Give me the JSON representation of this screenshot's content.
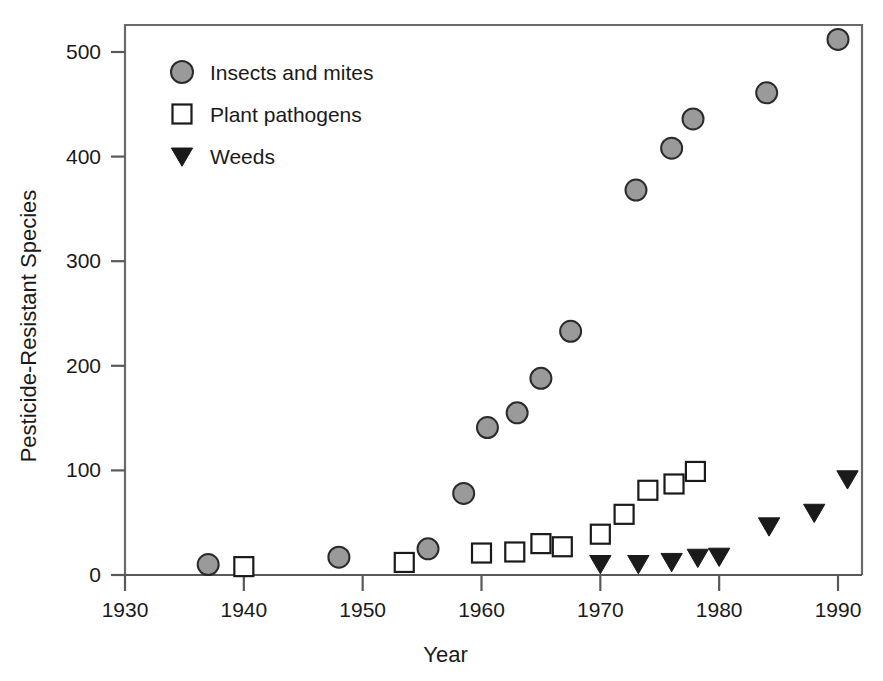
{
  "chart_data": {
    "type": "scatter",
    "title": "",
    "xlabel": "Year",
    "ylabel": "Pesticide-Resistant Species",
    "xlim": [
      1930,
      1992
    ],
    "ylim": [
      0,
      530
    ],
    "xticks": [
      1930,
      1940,
      1950,
      1960,
      1970,
      1980,
      1990
    ],
    "yticks": [
      0,
      100,
      200,
      300,
      400,
      500
    ],
    "xtick_labels": [
      "1930",
      "1940",
      "1950",
      "1960",
      "1970",
      "1980",
      "1990"
    ],
    "ytick_labels": [
      "0",
      "100",
      "200",
      "300",
      "400",
      "500"
    ],
    "grid": false,
    "legend_position": "upper-left-inside",
    "series": [
      {
        "name": "Insects and mites",
        "marker": "circle",
        "fill_color": "#9a9a9a",
        "edge_color": "#2b2b2b",
        "points": [
          {
            "x": 1937.0,
            "y": 10
          },
          {
            "x": 1948.0,
            "y": 17
          },
          {
            "x": 1955.5,
            "y": 25
          },
          {
            "x": 1958.5,
            "y": 78
          },
          {
            "x": 1960.5,
            "y": 141
          },
          {
            "x": 1963.0,
            "y": 155
          },
          {
            "x": 1965.0,
            "y": 188
          },
          {
            "x": 1967.5,
            "y": 233
          },
          {
            "x": 1973.0,
            "y": 368
          },
          {
            "x": 1976.0,
            "y": 408
          },
          {
            "x": 1977.8,
            "y": 436
          },
          {
            "x": 1984.0,
            "y": 461
          },
          {
            "x": 1990.0,
            "y": 512
          }
        ]
      },
      {
        "name": "Plant pathogens",
        "marker": "square",
        "fill_color": "#ffffff",
        "edge_color": "#1a1a1a",
        "points": [
          {
            "x": 1940.0,
            "y": 8
          },
          {
            "x": 1953.5,
            "y": 12
          },
          {
            "x": 1960.0,
            "y": 21
          },
          {
            "x": 1962.8,
            "y": 22
          },
          {
            "x": 1965.0,
            "y": 30
          },
          {
            "x": 1966.8,
            "y": 27
          },
          {
            "x": 1970.0,
            "y": 39
          },
          {
            "x": 1972.0,
            "y": 58
          },
          {
            "x": 1974.0,
            "y": 81
          },
          {
            "x": 1976.2,
            "y": 87
          },
          {
            "x": 1978.0,
            "y": 99
          }
        ]
      },
      {
        "name": "Weeds",
        "marker": "triangle-down",
        "fill_color": "#1a1a1a",
        "edge_color": "#1a1a1a",
        "points": [
          {
            "x": 1970.0,
            "y": 11
          },
          {
            "x": 1973.2,
            "y": 11
          },
          {
            "x": 1976.0,
            "y": 13
          },
          {
            "x": 1978.2,
            "y": 17
          },
          {
            "x": 1980.0,
            "y": 18
          },
          {
            "x": 1984.2,
            "y": 47
          },
          {
            "x": 1988.0,
            "y": 60
          },
          {
            "x": 1990.8,
            "y": 92
          }
        ]
      }
    ]
  },
  "legend": {
    "entries": [
      {
        "label": "Insects and mites",
        "marker": "circle"
      },
      {
        "label": "Plant pathogens",
        "marker": "square"
      },
      {
        "label": "Weeds",
        "marker": "triangle-down"
      }
    ]
  },
  "colors": {
    "axis": "#595959",
    "frame": "#6a6a6a",
    "text": "#1a1a1a",
    "circle_fill": "#9a9a9a",
    "circle_edge": "#2b2b2b",
    "square_fill": "#ffffff",
    "square_edge": "#1a1a1a",
    "triangle_fill": "#1a1a1a",
    "background": "#ffffff"
  }
}
